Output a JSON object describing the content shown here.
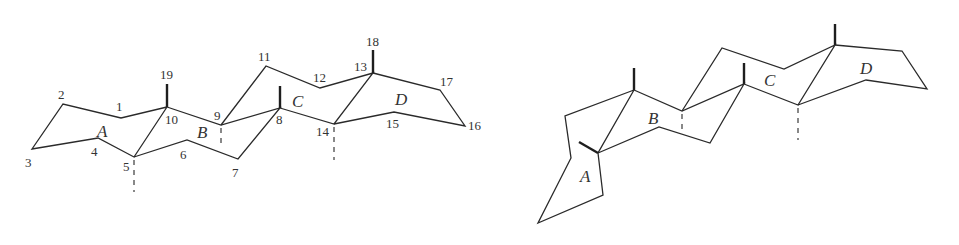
{
  "figure": {
    "colors": {
      "line": "#2a2a2a",
      "text": "#333333",
      "background": "#ffffff"
    }
  },
  "left_structure": {
    "ring_labels": {
      "A": "A",
      "B": "B",
      "C": "C",
      "D": "D"
    },
    "atom_labels": {
      "c1": "1",
      "c2": "2",
      "c3": "3",
      "c4": "4",
      "c5": "5",
      "c6": "6",
      "c7": "7",
      "c8": "8",
      "c9": "9",
      "c10": "10",
      "c11": "11",
      "c12": "12",
      "c13": "13",
      "c14": "14",
      "c15": "15",
      "c16": "16",
      "c17": "17",
      "c18": "18",
      "c19": "19"
    }
  },
  "right_structure": {
    "ring_labels": {
      "A": "A",
      "B": "B",
      "C": "C",
      "D": "D"
    }
  }
}
